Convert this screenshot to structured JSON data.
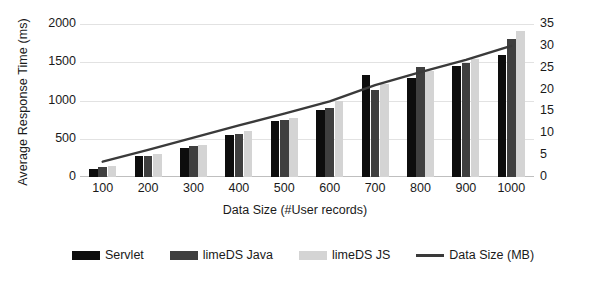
{
  "chart_data": {
    "type": "bar",
    "title": "",
    "xlabel": "Data Size (#User records)",
    "ylabel": "Average Response Time (ms)",
    "y2label": "I/O Size (MB)",
    "categories": [
      "100",
      "200",
      "300",
      "400",
      "500",
      "600",
      "700",
      "800",
      "900",
      "1000"
    ],
    "ylim": [
      0,
      2000
    ],
    "yticks": [
      "0",
      "500",
      "1000",
      "1500",
      "2000"
    ],
    "y2lim": [
      0,
      35
    ],
    "y2ticks": [
      "0",
      "5",
      "10",
      "15",
      "20",
      "25",
      "30",
      "35"
    ],
    "grid": true,
    "legend_position": "bottom",
    "series": [
      {
        "name": "Servlet",
        "type": "bar",
        "axis": "left",
        "color": "#0d0d0d",
        "values": [
          110,
          270,
          380,
          545,
          735,
          870,
          1340,
          1300,
          1455,
          1600
        ]
      },
      {
        "name": "limeDS Java",
        "type": "bar",
        "axis": "left",
        "color": "#3f3f3f",
        "values": [
          135,
          280,
          400,
          565,
          745,
          905,
          1140,
          1440,
          1495,
          1810
        ]
      },
      {
        "name": "limeDS JS",
        "type": "bar",
        "axis": "left",
        "color": "#d4d4d4",
        "values": [
          150,
          300,
          415,
          605,
          770,
          990,
          1215,
          1390,
          1545,
          1915
        ]
      },
      {
        "name": "Data Size (MB)",
        "type": "line",
        "axis": "right",
        "color": "#3a3a3a",
        "values": [
          3.5,
          6.2,
          9.0,
          11.8,
          14.5,
          17.3,
          21.0,
          24.0,
          26.8,
          30.0
        ]
      }
    ]
  },
  "legend": {
    "items": [
      {
        "label": "Servlet",
        "marker": "bar-swatch-black"
      },
      {
        "label": "limeDS Java",
        "marker": "bar-swatch-dark-gray"
      },
      {
        "label": "limeDS JS",
        "marker": "bar-swatch-light-gray"
      },
      {
        "label": "Data Size (MB)",
        "marker": "line-swatch"
      }
    ]
  }
}
